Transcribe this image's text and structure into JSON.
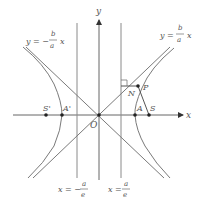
{
  "figure": {
    "type": "hyperbola-diagram",
    "colors": {
      "background": "#ffffff",
      "line": "#7a7a7a",
      "curve": "#7a7a7a",
      "axis": "#666666",
      "point": "#222222",
      "text": "#555555"
    },
    "axes": {
      "x_label": "x",
      "y_label": "y",
      "origin_label": "O"
    },
    "asymptotes": {
      "left_label_lhs": "y = −",
      "left_label_num": "b",
      "left_label_den": "a",
      "left_label_var": "x",
      "right_label_lhs": "y =",
      "right_label_num": "b",
      "right_label_den": "a",
      "right_label_var": "x"
    },
    "directrices": {
      "left_label_lhs": "x = −",
      "left_label_num": "a",
      "left_label_den": "e",
      "right_label_lhs": "x =",
      "right_label_num": "a",
      "right_label_den": "e"
    },
    "points": {
      "S_prime": "S'",
      "A_prime": "A'",
      "A": "A",
      "S": "S",
      "N": "N",
      "P": "P"
    }
  }
}
